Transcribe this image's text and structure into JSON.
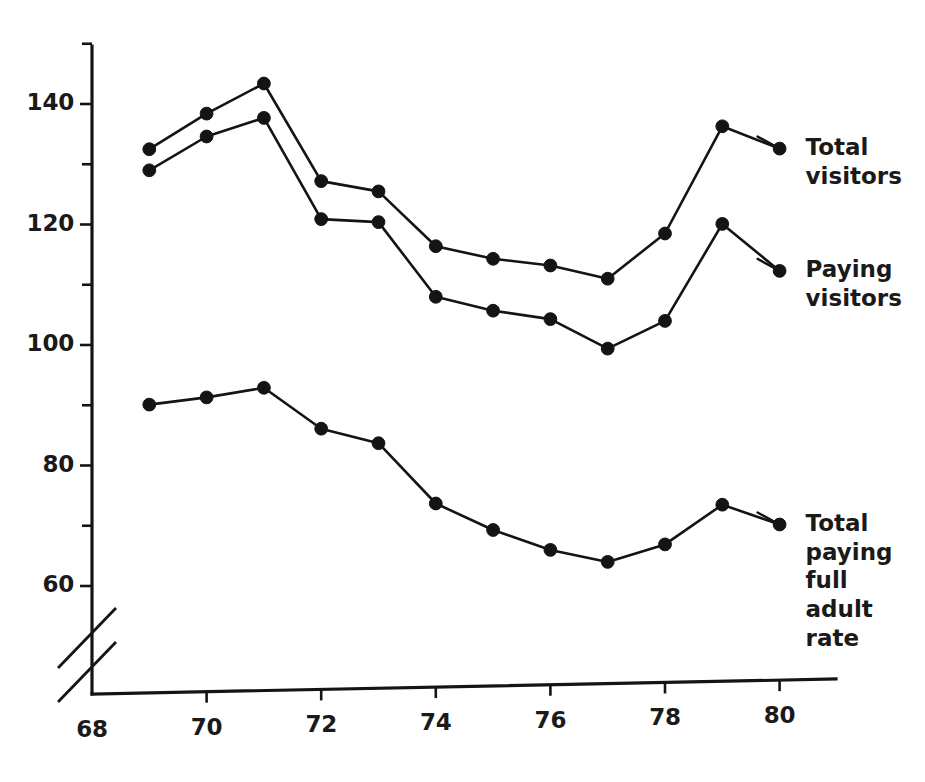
{
  "chart_data": {
    "type": "line",
    "title": "",
    "subtitle": "",
    "xlabel": "",
    "ylabel": "",
    "x": [
      69,
      70,
      71,
      72,
      73,
      74,
      75,
      76,
      77,
      78,
      79,
      80
    ],
    "xlim": [
      68,
      80.6
    ],
    "ylim": [
      58,
      150
    ],
    "y_axis_break": true,
    "y_axis_break_note": "axis broken below 60",
    "grid": false,
    "legend_position": "right-of-line-ends",
    "x_ticks": [
      68,
      70,
      72,
      74,
      76,
      78,
      80
    ],
    "x_tick_labels": [
      "68",
      "70",
      "72",
      "74",
      "76",
      "78",
      "80"
    ],
    "y_ticks": [
      60,
      70,
      80,
      90,
      100,
      110,
      120,
      130,
      140,
      150
    ],
    "y_tick_labels": [
      "60",
      "",
      "80",
      "",
      "100",
      "",
      "120",
      "",
      "140",
      ""
    ],
    "y_major_ticks": [
      60,
      80,
      100,
      120,
      140
    ],
    "y_minor_ticks": [
      70,
      90,
      110,
      130,
      150
    ],
    "marker": "filled-circle",
    "series": [
      {
        "name": "Total visitors",
        "label_lines": "Total\nvisitors",
        "x": [
          69,
          70,
          71,
          72,
          73,
          74,
          75,
          76,
          77,
          78,
          79,
          80
        ],
        "values": [
          132.5,
          138.4,
          143.4,
          127.2,
          125.5,
          116.4,
          114.3,
          113.2,
          111.0,
          118.5,
          136.3,
          132.6
        ]
      },
      {
        "name": "Paying visitors",
        "label_lines": "Paying\nvisitors",
        "x": [
          69,
          70,
          71,
          72,
          73,
          74,
          75,
          76,
          77,
          78,
          79,
          80
        ],
        "values": [
          129.0,
          134.6,
          137.7,
          120.9,
          120.4,
          108.0,
          105.7,
          104.3,
          99.4,
          104.0,
          120.1,
          112.3
        ]
      },
      {
        "name": "Total paying full adult rate",
        "label_lines": "Total\npaying\nfull\nadult\nrate",
        "x": [
          69,
          70,
          71,
          72,
          73,
          74,
          75,
          76,
          77,
          78,
          79,
          80
        ],
        "values": [
          90.1,
          91.3,
          92.9,
          86.1,
          83.7,
          73.7,
          69.3,
          66.0,
          64.0,
          66.9,
          73.5,
          70.2
        ]
      }
    ]
  },
  "colors": {
    "ink": "#141414",
    "background": "#ffffff"
  }
}
